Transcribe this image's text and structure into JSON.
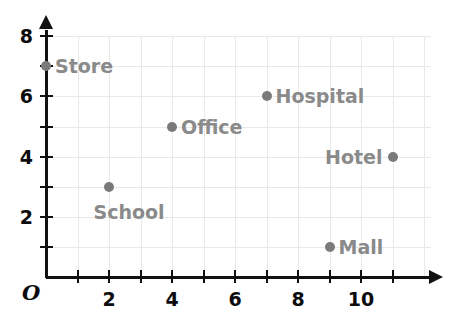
{
  "chart_data": {
    "type": "scatter",
    "title": "",
    "xlabel": "",
    "ylabel": "",
    "origin_label": "O",
    "xlim": [
      0,
      12
    ],
    "ylim": [
      0,
      8
    ],
    "grid": true,
    "legend": "none",
    "x_ticks": [
      1,
      2,
      3,
      4,
      5,
      6,
      7,
      8,
      9,
      10,
      11
    ],
    "y_ticks": [
      1,
      2,
      3,
      4,
      5,
      6,
      7,
      8
    ],
    "x_tick_labels": [
      {
        "value": 2,
        "text": "2"
      },
      {
        "value": 4,
        "text": "4"
      },
      {
        "value": 6,
        "text": "6"
      },
      {
        "value": 8,
        "text": "8"
      },
      {
        "value": 10,
        "text": "10"
      }
    ],
    "y_tick_labels": [
      {
        "value": 2,
        "text": "2"
      },
      {
        "value": 4,
        "text": "4"
      },
      {
        "value": 6,
        "text": "6"
      },
      {
        "value": 8,
        "text": "8"
      }
    ],
    "points": [
      {
        "label": "Store",
        "x": 0,
        "y": 7,
        "label_pos": "right"
      },
      {
        "label": "School",
        "x": 2,
        "y": 3,
        "label_pos": "below"
      },
      {
        "label": "Office",
        "x": 4,
        "y": 5,
        "label_pos": "right"
      },
      {
        "label": "Hospital",
        "x": 7,
        "y": 6,
        "label_pos": "right"
      },
      {
        "label": "Hotel",
        "x": 11,
        "y": 4,
        "label_pos": "left"
      },
      {
        "label": "Mall",
        "x": 9,
        "y": 1,
        "label_pos": "right"
      }
    ],
    "colors": {
      "point": "#7a7a7a",
      "point_label": "#8a8a8a",
      "axis": "#111111",
      "grid": "#e9e9e9",
      "tick_label": "#0c0c0c",
      "background": "#ffffff"
    }
  }
}
